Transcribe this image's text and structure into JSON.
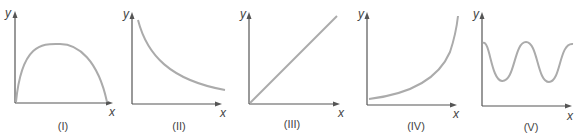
{
  "colors": {
    "axis": "#555555",
    "curve": "#ababab",
    "text": "#444444"
  },
  "axes": {
    "x_label": "x",
    "y_label": "y"
  },
  "panels": [
    {
      "id": "I",
      "label": "(I)",
      "shape": "inverted-parabola",
      "description": "Rises from origin to a maximum then falls back to zero"
    },
    {
      "id": "II",
      "label": "(II)",
      "shape": "decreasing-decay",
      "description": "Starts high and decreases, flattening out (inverse/exponential decay)"
    },
    {
      "id": "III",
      "label": "(III)",
      "shape": "linear-increasing",
      "description": "Straight line through origin with positive slope"
    },
    {
      "id": "IV",
      "label": "(IV)",
      "shape": "exponential-growth",
      "description": "Starts low with positive intercept and increases ever more steeply"
    },
    {
      "id": "V",
      "label": "(V)",
      "shape": "periodic-oscillation",
      "description": "Oscillating wave above the x-axis"
    }
  ]
}
